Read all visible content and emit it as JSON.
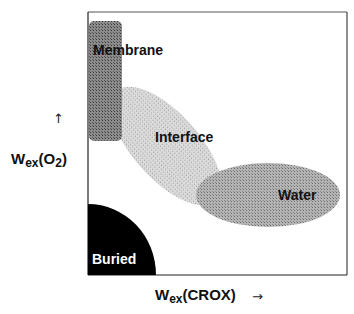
{
  "figure": {
    "type": "region-diagram",
    "frame": {
      "x": 88,
      "y": 12,
      "width": 259,
      "height": 263
    }
  },
  "regions": [
    {
      "name": "membrane",
      "label": "Membrane",
      "fill": "#7a7a7a",
      "label_color": "#111111"
    },
    {
      "name": "interface",
      "label": "Interface",
      "fill": "#d2d2d2",
      "label_color": "#111111"
    },
    {
      "name": "water",
      "label": "Water",
      "fill": "#a9a9a9",
      "label_color": "#111111"
    },
    {
      "name": "buried",
      "label": "Buried",
      "fill": "#000000",
      "label_color": "#ffffff"
    }
  ],
  "axes": {
    "y": {
      "symbol": "W",
      "subscript": "ex",
      "argument": "(O",
      "arg_sub": "2",
      "close": ")",
      "arrow": "↑"
    },
    "x": {
      "symbol": "W",
      "subscript": "ex",
      "argument": "(CROX)",
      "arrow": "→"
    }
  }
}
